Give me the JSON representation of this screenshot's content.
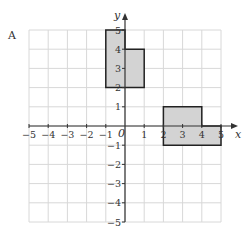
{
  "question_label": "A",
  "axes": {
    "x_label": "x",
    "y_label": "y",
    "origin_label": "0",
    "x_ticks": [
      "−5",
      "−4",
      "−3",
      "−2",
      "−1",
      "1",
      "2",
      "3",
      "4",
      "5"
    ],
    "y_ticks": [
      "5",
      "4",
      "3",
      "2",
      "1",
      "−1",
      "−2",
      "−3",
      "−4",
      "−5"
    ],
    "xlim": [
      -5,
      5
    ],
    "ylim": [
      -5,
      5
    ]
  },
  "shapes": [
    {
      "name": "shape-left",
      "points": [
        [
          -1,
          5
        ],
        [
          0,
          5
        ],
        [
          0,
          4
        ],
        [
          1,
          4
        ],
        [
          1,
          2
        ],
        [
          -1,
          2
        ]
      ],
      "fill": "#d3d3d3"
    },
    {
      "name": "shape-right",
      "points": [
        [
          2,
          1
        ],
        [
          4,
          1
        ],
        [
          4,
          0
        ],
        [
          5,
          0
        ],
        [
          5,
          -1
        ],
        [
          2,
          -1
        ]
      ],
      "fill": "#d3d3d3"
    }
  ],
  "colors": {
    "grid": "#d8d8d8",
    "axis": "#333333",
    "shape_stroke": "#222222"
  }
}
